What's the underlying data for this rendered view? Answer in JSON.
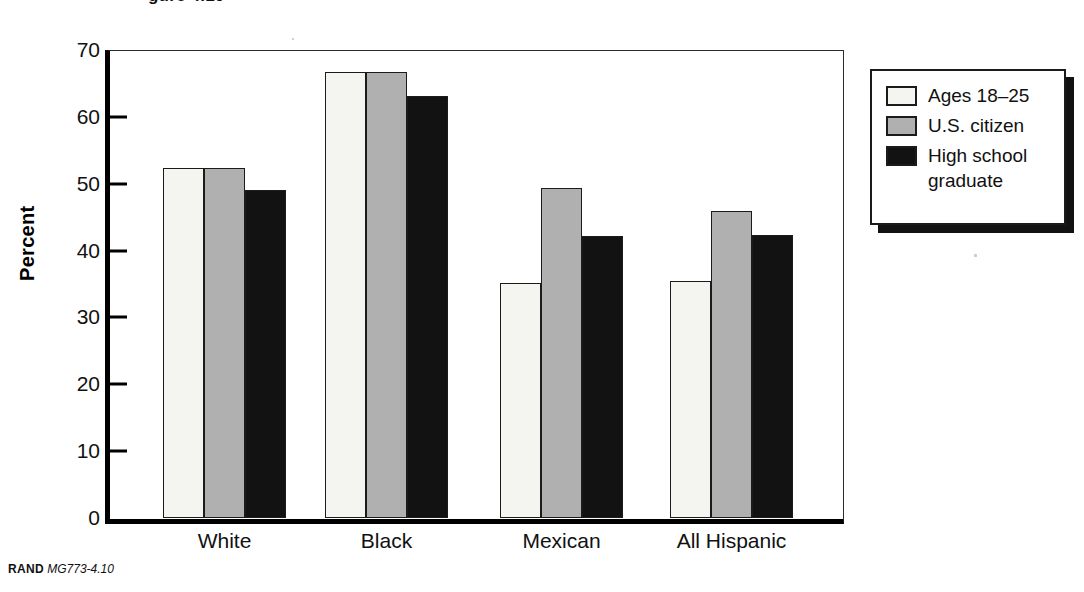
{
  "figure": {
    "title_fragment": "gure 4.10",
    "footer_source": "RAND",
    "footer_code": "MG773-4.10"
  },
  "chart_data": {
    "type": "bar",
    "title": "",
    "xlabel": "",
    "ylabel": "Percent",
    "ylim": [
      0,
      70
    ],
    "yticks": [
      0,
      10,
      20,
      30,
      40,
      50,
      60,
      70
    ],
    "ytick_labels": [
      "0",
      "10",
      "20",
      "30",
      "40",
      "50",
      "60",
      "70"
    ],
    "grid": false,
    "legend_position": "right-outside",
    "categories": [
      "White",
      "Black",
      "Mexican",
      "All Hispanic"
    ],
    "series": [
      {
        "name": "Ages 18–25",
        "color": "#f4f4f0",
        "values": [
          52.4,
          66.7,
          35.2,
          35.4
        ]
      },
      {
        "name": "U.S. citizen",
        "color": "#b0b0b0",
        "values": [
          52.4,
          66.7,
          49.4,
          45.9
        ]
      },
      {
        "name": "High school graduate",
        "color": "#121212",
        "values": [
          49.1,
          63.1,
          42.2,
          42.4
        ]
      }
    ]
  },
  "legend": {
    "entries": [
      {
        "label": "Ages 18–25",
        "color": "#f4f4f0"
      },
      {
        "label": "U.S. citizen",
        "color": "#b0b0b0"
      },
      {
        "label": "High school graduate",
        "color": "#121212"
      }
    ]
  }
}
